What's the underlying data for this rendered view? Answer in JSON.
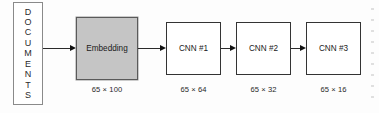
{
  "diagram": {
    "type": "pipeline-flow-diagram",
    "background_color": "#fdfdfd",
    "source": {
      "label": "DOCUMENTS",
      "letters": [
        "D",
        "O",
        "C",
        "U",
        "M",
        "E",
        "N",
        "T",
        "S"
      ],
      "orientation": "vertical-stacked",
      "fill_color": "#ffffff",
      "border_color": "#8a8a8a"
    },
    "stages": [
      {
        "id": "embedding",
        "label": "Embedding",
        "dimension_caption": "65 × 100",
        "fill_color": "#c5c5c5",
        "border_color": "#5a5a5a",
        "highlighted": true
      },
      {
        "id": "cnn-1",
        "label": "CNN #1",
        "dimension_caption": "65 × 64",
        "fill_color": "#ffffff",
        "border_color": "#333333",
        "highlighted": false
      },
      {
        "id": "cnn-2",
        "label": "CNN #2",
        "dimension_caption": "65 × 32",
        "fill_color": "#ffffff",
        "border_color": "#333333",
        "highlighted": false
      },
      {
        "id": "cnn-3",
        "label": "CNN #3",
        "dimension_caption": "65 × 16",
        "fill_color": "#ffffff",
        "border_color": "#333333",
        "highlighted": false
      }
    ],
    "connectors": [
      {
        "id": "arrow-documents-to-embedding",
        "from": "documents",
        "to": "embedding"
      },
      {
        "id": "arrow-embedding-to-cnn-1",
        "from": "embedding",
        "to": "cnn-1"
      },
      {
        "id": "arrow-cnn-1-to-cnn-2",
        "from": "cnn-1",
        "to": "cnn-2"
      },
      {
        "id": "arrow-cnn-2-to-cnn-3",
        "from": "cnn-2",
        "to": "cnn-3"
      }
    ]
  }
}
